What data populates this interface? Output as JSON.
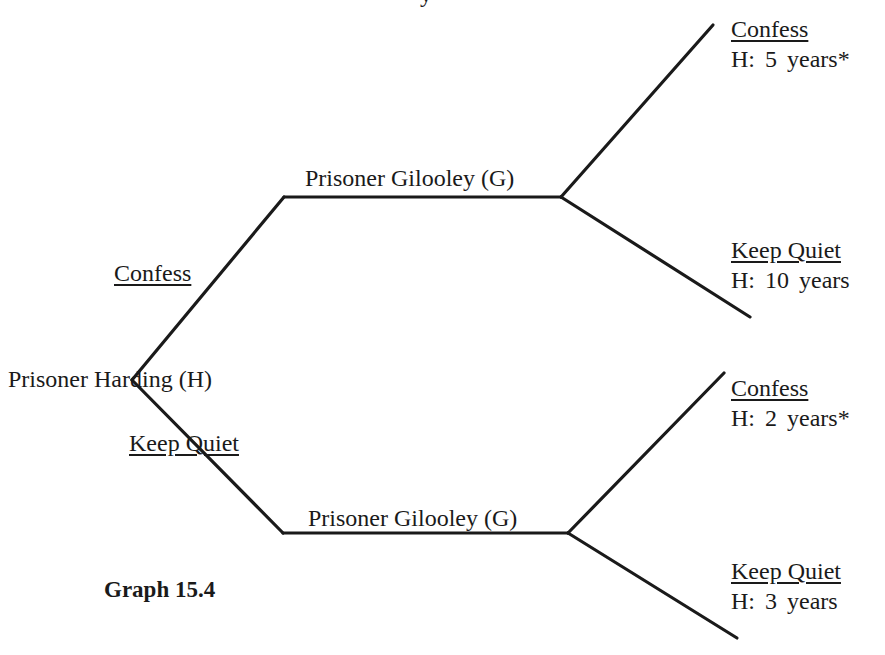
{
  "title_fragment": "y",
  "caption": "Graph 15.4",
  "colors": {
    "line": "#1a1a1a",
    "text": "#1a1a1a",
    "background": "#ffffff"
  },
  "root": {
    "label": "Prisoner Harding (H)",
    "branches": [
      {
        "label": "Confess"
      },
      {
        "label": "Keep Quiet"
      }
    ]
  },
  "nodes": [
    {
      "label": "Prisoner Gilooley (G)",
      "after": "Harding Confess",
      "outcomes": [
        {
          "action": "Confess",
          "payoff": "H:  5 years*"
        },
        {
          "action": "Keep Quiet",
          "payoff": "H:  10 years"
        }
      ]
    },
    {
      "label": "Prisoner Gilooley (G)",
      "after": "Harding Keep Quiet",
      "outcomes": [
        {
          "action": "Confess",
          "payoff": "H:  2 years*"
        },
        {
          "action": "Keep Quiet",
          "payoff": "H:  3 years"
        }
      ]
    }
  ]
}
